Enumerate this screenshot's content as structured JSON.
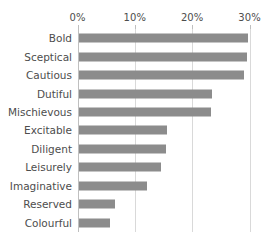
{
  "chart_data": {
    "type": "bar",
    "orientation": "horizontal",
    "title": "",
    "subtitle": "",
    "xlabel": "",
    "ylabel": "",
    "xlim": [
      0,
      30
    ],
    "xticks": [
      0,
      10,
      20,
      30
    ],
    "xtick_labels": [
      "0%",
      "10%",
      "20%",
      "30%"
    ],
    "xtick_label_position": "top",
    "grid": "vertical",
    "legend": "none",
    "bar_color": "#8c8c8c",
    "gridline_color": "#d9d9d9",
    "axis_color": "#bfbfbf",
    "text_color": "#4d4d4d",
    "value_unit": "%",
    "categories": [
      "Bold",
      "Sceptical",
      "Cautious",
      "Dutiful",
      "Mischievous",
      "Excitable",
      "Diligent",
      "Leisurely",
      "Imaginative",
      "Reserved",
      "Colourful"
    ],
    "values": [
      29.5,
      29.4,
      28.9,
      23.2,
      23.1,
      15.4,
      15.3,
      14.4,
      11.9,
      6.4,
      5.5
    ],
    "bars": [
      {
        "label": "Bold",
        "value": 29.5
      },
      {
        "label": "Sceptical",
        "value": 29.4
      },
      {
        "label": "Cautious",
        "value": 28.9
      },
      {
        "label": "Dutiful",
        "value": 23.2
      },
      {
        "label": "Mischievous",
        "value": 23.1
      },
      {
        "label": "Excitable",
        "value": 15.4
      },
      {
        "label": "Diligent",
        "value": 15.3
      },
      {
        "label": "Leisurely",
        "value": 14.4
      },
      {
        "label": "Imaginative",
        "value": 11.9
      },
      {
        "label": "Reserved",
        "value": 6.4
      },
      {
        "label": "Colourful",
        "value": 5.5
      }
    ]
  }
}
